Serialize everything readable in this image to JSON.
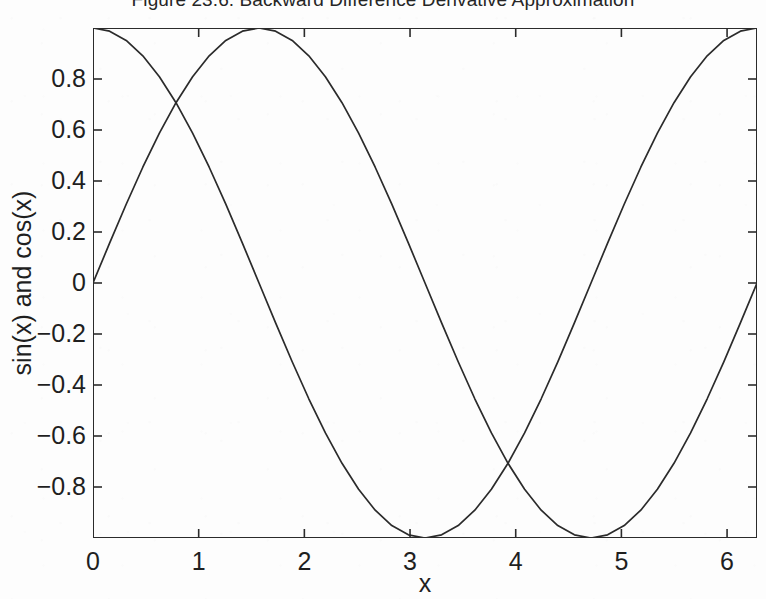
{
  "figure": {
    "title": "Figure 23.6. Backward Difference Derivative Approximation",
    "background_color": "#fdfdfd",
    "line_color": "#2b2b2b",
    "axis_color": "#2b2b2b"
  },
  "chart_data": {
    "type": "line",
    "title": "Figure 23.6. Backward Difference Derivative Approximation",
    "xlabel": "x",
    "ylabel": "sin(x) and cos(x)",
    "xlim": [
      0,
      6.2832
    ],
    "ylim": [
      -1,
      1
    ],
    "grid": false,
    "legend": null,
    "xticks": [
      0,
      1,
      2,
      3,
      4,
      5,
      6
    ],
    "xtick_labels": [
      "0",
      "1",
      "2",
      "3",
      "4",
      "5",
      "6"
    ],
    "yticks": [
      -0.8,
      -0.6,
      -0.4,
      -0.2,
      0,
      0.2,
      0.4,
      0.6,
      0.8
    ],
    "ytick_labels": [
      "−0.8",
      "−0.6",
      "−0.4",
      "−0.2",
      "0",
      "0.2",
      "0.4",
      "0.6",
      "0.8"
    ],
    "series": [
      {
        "name": "sin(x)",
        "color": "#2b2b2b",
        "x": [
          0,
          0.1571,
          0.3142,
          0.4712,
          0.6283,
          0.7854,
          0.9425,
          1.0996,
          1.2566,
          1.4137,
          1.5708,
          1.7279,
          1.885,
          2.042,
          2.1991,
          2.3562,
          2.5133,
          2.6704,
          2.8274,
          2.9845,
          3.1416,
          3.2987,
          3.4558,
          3.6128,
          3.7699,
          3.927,
          4.0841,
          4.2412,
          4.3982,
          4.5553,
          4.7124,
          4.8695,
          5.0265,
          5.1836,
          5.3407,
          5.4978,
          5.6549,
          5.8119,
          5.969,
          6.1261,
          6.2832
        ],
        "y": [
          0,
          0.1564,
          0.309,
          0.454,
          0.5878,
          0.7071,
          0.809,
          0.891,
          0.9511,
          0.9877,
          1,
          0.9877,
          0.9511,
          0.891,
          0.809,
          0.7071,
          0.5878,
          0.454,
          0.309,
          0.1564,
          0,
          -0.1564,
          -0.309,
          -0.454,
          -0.5878,
          -0.7071,
          -0.809,
          -0.891,
          -0.9511,
          -0.9877,
          -1,
          -0.9877,
          -0.9511,
          -0.891,
          -0.809,
          -0.7071,
          -0.5878,
          -0.454,
          -0.309,
          -0.1564,
          0
        ]
      },
      {
        "name": "cos(x)",
        "color": "#2b2b2b",
        "x": [
          0,
          0.1571,
          0.3142,
          0.4712,
          0.6283,
          0.7854,
          0.9425,
          1.0996,
          1.2566,
          1.4137,
          1.5708,
          1.7279,
          1.885,
          2.042,
          2.1991,
          2.3562,
          2.5133,
          2.6704,
          2.8274,
          2.9845,
          3.1416,
          3.2987,
          3.4558,
          3.6128,
          3.7699,
          3.927,
          4.0841,
          4.2412,
          4.3982,
          4.5553,
          4.7124,
          4.8695,
          5.0265,
          5.1836,
          5.3407,
          5.4978,
          5.6549,
          5.8119,
          5.969,
          6.1261,
          6.2832
        ],
        "y": [
          1,
          0.9877,
          0.9511,
          0.891,
          0.809,
          0.7071,
          0.5878,
          0.454,
          0.309,
          0.1564,
          0,
          -0.1564,
          -0.309,
          -0.454,
          -0.5878,
          -0.7071,
          -0.809,
          -0.891,
          -0.9511,
          -0.9877,
          -1,
          -0.9877,
          -0.9511,
          -0.891,
          -0.809,
          -0.7071,
          -0.5878,
          -0.454,
          -0.309,
          -0.1564,
          0,
          0.1564,
          0.309,
          0.454,
          0.5878,
          0.7071,
          0.809,
          0.891,
          0.9511,
          0.9877,
          1
        ]
      }
    ]
  }
}
